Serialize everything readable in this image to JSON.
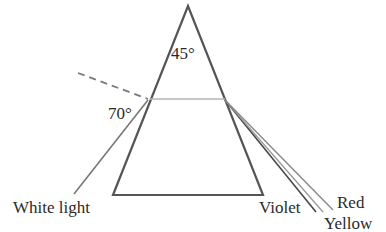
{
  "diagram": {
    "apex_angle_label": "45°",
    "incidence_angle_label": "70°",
    "labels": {
      "incoming": "White light",
      "violet": "Violet",
      "red": "Red",
      "yellow": "Yellow"
    },
    "colors": {
      "prism": "#555555",
      "ray": "#6e6e6e",
      "internal_ray": "#b0b0b0",
      "normal": "#7a7a7a"
    }
  }
}
